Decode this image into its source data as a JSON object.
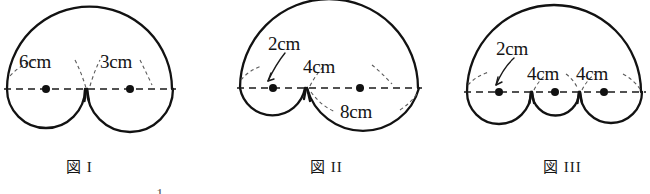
{
  "document": {
    "kind": "math-figure-illustration",
    "background_color": "#ffffff",
    "ink_color": "#121212"
  },
  "figures": [
    {
      "id": "figure-1",
      "caption": "図 I",
      "description": "Large semicircular arc above a horizontal dashed axis, with two semicircles below the axis",
      "labels": [
        {
          "name": "radius-6cm",
          "text": "6cm"
        },
        {
          "name": "radius-3cm",
          "text": "3cm"
        }
      ],
      "lower_semicircles": [
        {
          "name": "left-semicircle",
          "diameter_label": "6cm"
        },
        {
          "name": "right-semicircle",
          "diameter_label": "3cm"
        }
      ],
      "center_dots": 2
    },
    {
      "id": "figure-2",
      "caption": "図 II",
      "description": "Large arc above a horizontal dashed axis, with a small and a large semicircle below the axis",
      "labels": [
        {
          "name": "radius-2cm",
          "text": "2cm"
        },
        {
          "name": "radius-4cm",
          "text": "4cm"
        },
        {
          "name": "radius-8cm",
          "text": "8cm"
        }
      ],
      "lower_semicircles": [
        {
          "name": "left-small-semicircle",
          "diameter_label": "2cm"
        },
        {
          "name": "right-large-semicircle",
          "diameter_label": "4cm"
        }
      ],
      "center_dots": 2
    },
    {
      "id": "figure-3",
      "caption": "図 III",
      "description": "Large arc above a horizontal dashed axis, with three semicircles below the axis",
      "labels": [
        {
          "name": "radius-2cm",
          "text": "2cm"
        },
        {
          "name": "radius-4cm-middle",
          "text": "4cm"
        },
        {
          "name": "radius-4cm-right",
          "text": "4cm"
        }
      ],
      "lower_semicircles": [
        {
          "name": "left-semicircle",
          "diameter_label": "2cm"
        },
        {
          "name": "middle-semicircle",
          "diameter_label": "4cm"
        },
        {
          "name": "right-semicircle",
          "diameter_label": "4cm"
        }
      ],
      "center_dots": 3
    }
  ],
  "footer": {
    "page_number": "1"
  }
}
